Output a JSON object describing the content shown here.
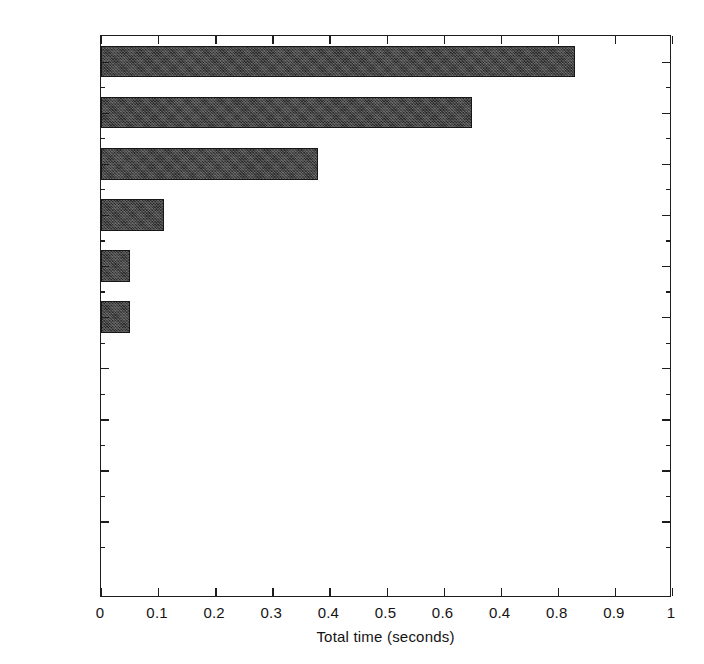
{
  "chart_data": {
    "type": "bar",
    "orientation": "horizontal",
    "title": "",
    "xlabel": "Total time (seconds)",
    "ylabel": "",
    "categories": [
      "membrane",
      "besselj",
      "besselmx",
      "besschk",
      "log10",
      "meshgrid",
      "profile",
      "rot90",
      "realmax",
      "realmin"
    ],
    "values": [
      0.83,
      0.65,
      0.38,
      0.11,
      0.05,
      0.05,
      0,
      0,
      0,
      0
    ],
    "xlim": [
      0,
      1
    ],
    "xticks": [
      0,
      0.1,
      0.2,
      0.3,
      0.4,
      0.5,
      0.6,
      0.7,
      0.8,
      0.9,
      1
    ],
    "xtick_labels": [
      "0",
      "0.1",
      "0.2",
      "0.3",
      "0.4",
      "0.5",
      "0.6",
      "0.4",
      "0.8",
      "0.9",
      "1"
    ],
    "grid": false,
    "legend": null,
    "bar_color": "#2a2a2a",
    "axis_color": "#1d1d1d",
    "background": "#ffffff"
  }
}
